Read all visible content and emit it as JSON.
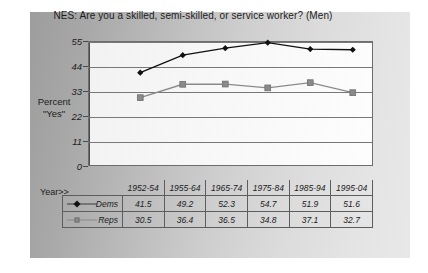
{
  "chart_data": {
    "type": "line",
    "title": "NES: Are you a skilled, semi-skilled, or service worker? (Men)",
    "xlabel": "Year>>",
    "ylabel": "Percent \"Yes\"",
    "ylabel_line1": "Percent",
    "ylabel_line2": "\"Yes\"",
    "categories": [
      "1952-54",
      "1955-64",
      "1965-74",
      "1975-84",
      "1985-94",
      "1995-04"
    ],
    "series": [
      {
        "name": "Dems",
        "marker": "diamond",
        "color": "#111111",
        "values": [
          41.5,
          49.2,
          52.3,
          54.7,
          51.9,
          51.6
        ]
      },
      {
        "name": "Reps",
        "marker": "square",
        "color": "#8a8a8a",
        "values": [
          30.5,
          36.4,
          36.5,
          34.8,
          37.1,
          32.7
        ]
      }
    ],
    "ylim": [
      0,
      55
    ],
    "yticks": [
      0,
      11,
      22,
      33,
      44,
      55
    ],
    "ytick_labels": [
      "0",
      "11",
      "22",
      "33",
      "44",
      "55"
    ],
    "grid": true,
    "legend_position": "data-table-below"
  }
}
